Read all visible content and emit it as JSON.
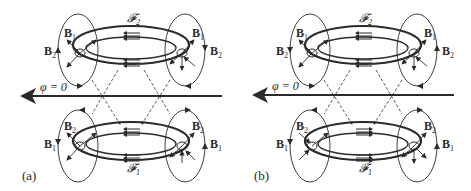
{
  "figure": {
    "panels": [
      {
        "id": "a",
        "label": "(a)",
        "axis_label": "φ = 0",
        "top_torus": {
          "flux_label": "𝓕",
          "flux_sub": "2",
          "left_labels": [
            "B",
            "B"
          ],
          "left_subs": [
            "1",
            "2"
          ],
          "right_labels": [
            "B",
            "B"
          ],
          "right_subs": [
            "1",
            "2"
          ]
        },
        "bottom_torus": {
          "flux_label": "𝓕",
          "flux_sub": "1",
          "left_labels": [
            "B",
            "B"
          ],
          "left_subs": [
            "2",
            "1"
          ],
          "right_labels": [
            "B",
            "B"
          ],
          "right_subs": [
            "2",
            "1"
          ]
        }
      },
      {
        "id": "b",
        "label": "(b)",
        "axis_label": "φ = 0",
        "top_torus": {
          "flux_label": "𝓕",
          "flux_sub": "2",
          "left_labels": [
            "B",
            "B"
          ],
          "left_subs": [
            "1",
            "2"
          ],
          "right_labels": [
            "B",
            "B"
          ],
          "right_subs": [
            "1",
            "2"
          ]
        },
        "bottom_torus": {
          "flux_label": "𝓕",
          "flux_sub": "1",
          "left_labels": [
            "B",
            "B"
          ],
          "left_subs": [
            "2",
            "1"
          ],
          "right_labels": [
            "B",
            "B"
          ],
          "right_subs": [
            "2",
            "1"
          ]
        }
      }
    ]
  }
}
